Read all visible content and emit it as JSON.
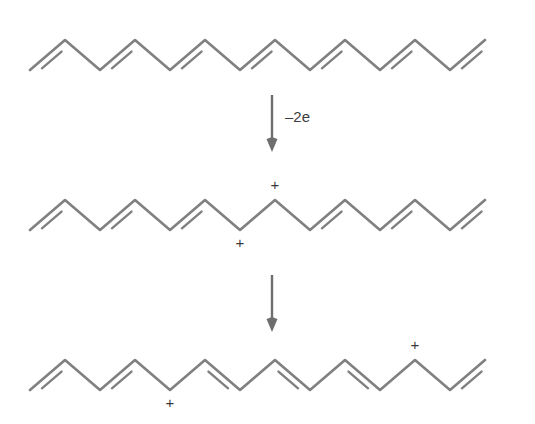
{
  "figure": {
    "background_color": "#ffffff",
    "line_color": "#808080",
    "arrow_color": "#6e6e6e",
    "text_color": "#3a3a3a"
  },
  "geometry": {
    "amplitude": 30,
    "step": 35,
    "vertex_count": 14,
    "left_margin": 30,
    "double_offset": 6.5,
    "double_trim": 0.22
  },
  "chains": [
    {
      "id": "chain-neutral",
      "name": "neutral-chain",
      "baseline_y": 70,
      "start_x": 30,
      "start_dir": "up",
      "double_bond_segments": [
        0,
        2,
        4,
        6,
        8,
        10,
        12
      ],
      "charges": []
    },
    {
      "id": "chain-bipolaron",
      "name": "bipolaron-chain",
      "baseline_y": 230,
      "start_x": 30,
      "start_dir": "up",
      "double_bond_segments": [
        0,
        2,
        4,
        8,
        10,
        12
      ],
      "charges": [
        {
          "symbol": "+",
          "vertex": 6,
          "position": "valley",
          "label_dx": 0,
          "label_dy": 14
        },
        {
          "symbol": "+",
          "vertex": 7,
          "position": "peak",
          "label_dx": 0,
          "label_dy": -14
        }
      ]
    },
    {
      "id": "chain-polarons",
      "name": "separated-polarons-chain",
      "baseline_y": 390,
      "start_x": 30,
      "start_dir": "up",
      "double_bond_segments": [
        0,
        2,
        5,
        7,
        9,
        12
      ],
      "charges": [
        {
          "symbol": "+",
          "vertex": 4,
          "position": "valley",
          "label_dx": 0,
          "label_dy": 14
        },
        {
          "symbol": "+",
          "vertex": 11,
          "position": "peak",
          "label_dx": 0,
          "label_dy": -14
        }
      ]
    }
  ],
  "arrows": [
    {
      "id": "arrow-oxidation",
      "name": "oxidation-arrow",
      "x": 272,
      "y_start": 95,
      "y_end": 152,
      "label": "–2e",
      "label_x": 285,
      "label_y": 118
    },
    {
      "id": "arrow-separation",
      "name": "polaron-separation-arrow",
      "x": 272,
      "y_start": 275,
      "y_end": 332,
      "label": "",
      "label_x": 285,
      "label_y": 300
    }
  ]
}
